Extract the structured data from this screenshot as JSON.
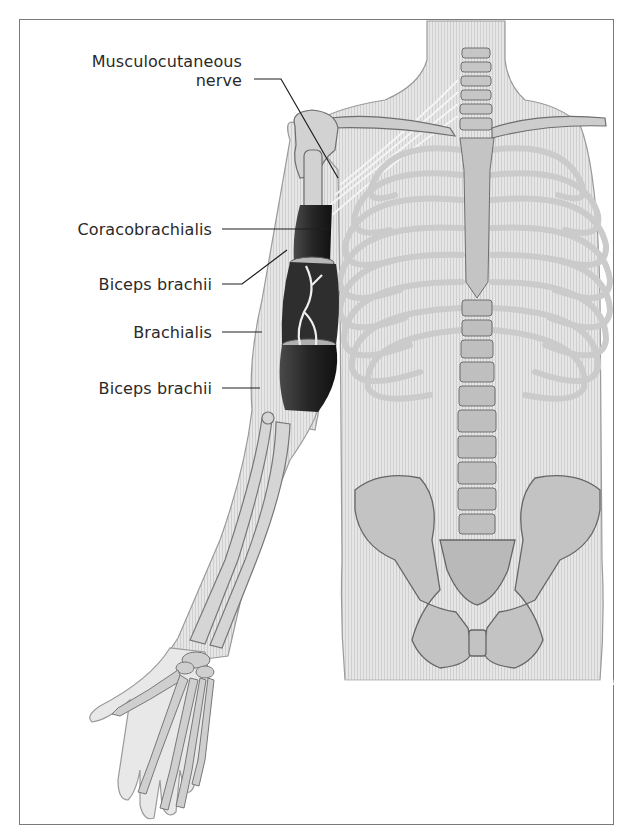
{
  "figure": {
    "labels": [
      {
        "id": "musculocutaneous",
        "line1": "Musculocutaneous",
        "line2": "nerve"
      },
      {
        "id": "coracobrachialis",
        "text": "Coracobrachialis"
      },
      {
        "id": "biceps-upper",
        "text": "Biceps brachii"
      },
      {
        "id": "brachialis",
        "text": "Brachialis"
      },
      {
        "id": "biceps-lower",
        "text": "Biceps brachii"
      }
    ],
    "colors": {
      "frame": "#7a7a7a",
      "label_text": "#2a2a2a",
      "skin_fill": "#e2e2e2",
      "bone_fill": "#c9c9c9",
      "bone_stroke": "#6e6e6e",
      "muscle_dark": "#2b2b2b",
      "leader_line": "#1e1e1e"
    }
  }
}
